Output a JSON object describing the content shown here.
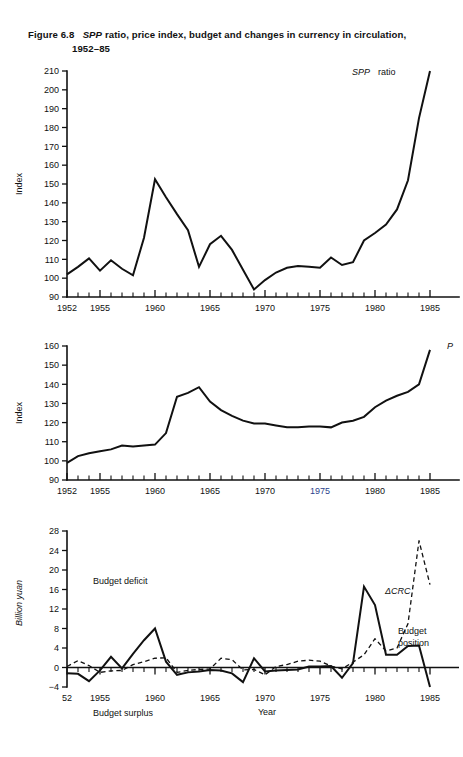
{
  "figure": {
    "number": "Figure 6.8",
    "title_italic_lead": "SPP",
    "title_rest": " ratio, price index, budget and changes in currency in circulation,",
    "title_line2": "1952–85"
  },
  "chart_data": [
    {
      "id": "spp-ratio",
      "type": "line",
      "title": "",
      "xlabel": "",
      "ylabel": "Index",
      "series_label": "SPP ratio",
      "ylim": [
        90,
        210
      ],
      "yticks": [
        90,
        100,
        110,
        120,
        130,
        140,
        150,
        160,
        170,
        180,
        190,
        200,
        210
      ],
      "xlim": [
        1952,
        1986
      ],
      "xticks": [
        1952,
        1955,
        1960,
        1965,
        1970,
        1975,
        1980,
        1985
      ],
      "xtick_labels": [
        "1952",
        "1955",
        "1960",
        "1965",
        "1970",
        "1975",
        "1980",
        "1985"
      ],
      "grid": false,
      "x": [
        1952,
        1953,
        1954,
        1955,
        1956,
        1957,
        1958,
        1959,
        1960,
        1961,
        1962,
        1963,
        1964,
        1965,
        1966,
        1967,
        1968,
        1969,
        1970,
        1971,
        1972,
        1973,
        1974,
        1975,
        1976,
        1977,
        1978,
        1979,
        1980,
        1981,
        1982,
        1983,
        1984,
        1985
      ],
      "values": [
        102,
        106,
        110.5,
        104,
        109.5,
        105,
        101.5,
        121.5,
        152.5,
        143,
        134,
        125.5,
        106,
        118,
        122.5,
        115,
        104.5,
        94,
        99,
        103,
        105.5,
        106.5,
        106,
        105.5,
        111,
        107,
        108.5,
        120,
        124,
        128.5,
        136.5,
        152,
        185,
        210
      ]
    },
    {
      "id": "price-index",
      "type": "line",
      "title": "",
      "xlabel": "",
      "ylabel": "Index",
      "series_label": "P",
      "ylim": [
        90,
        160
      ],
      "yticks": [
        90,
        100,
        110,
        120,
        130,
        140,
        150,
        160
      ],
      "xlim": [
        1952,
        1986
      ],
      "xticks": [
        1952,
        1955,
        1960,
        1965,
        1970,
        1975,
        1980,
        1985
      ],
      "xtick_labels": [
        "1952",
        "1955",
        "1960",
        "1965",
        "1970",
        "1975",
        "1980",
        "1985"
      ],
      "highlight_xtick": "1975",
      "grid": false,
      "x": [
        1952,
        1953,
        1954,
        1955,
        1956,
        1957,
        1958,
        1959,
        1960,
        1961,
        1962,
        1963,
        1964,
        1965,
        1966,
        1967,
        1968,
        1969,
        1970,
        1971,
        1972,
        1973,
        1974,
        1975,
        1976,
        1977,
        1978,
        1979,
        1980,
        1981,
        1982,
        1983,
        1984,
        1985
      ],
      "values": [
        99,
        102.5,
        104,
        105,
        106,
        108,
        107.5,
        108,
        108.5,
        114.5,
        133.5,
        135.5,
        138.5,
        131,
        126.5,
        123.5,
        121,
        119.5,
        119.5,
        118.5,
        117.5,
        117.5,
        118,
        118,
        117.5,
        120,
        121,
        123,
        128,
        131.5,
        134,
        136,
        140,
        158
      ]
    },
    {
      "id": "budget-crc",
      "type": "line",
      "title": "",
      "xlabel": "Year",
      "ylabel": "Billion yuan",
      "ylim": [
        -4,
        28
      ],
      "yticks": [
        -4,
        0,
        4,
        8,
        12,
        16,
        20,
        24,
        28
      ],
      "xlim": [
        1952,
        1986
      ],
      "xticks": [
        1952,
        1955,
        1960,
        1965,
        1970,
        1975,
        1980,
        1985
      ],
      "xtick_labels": [
        "52",
        "1955",
        "1960",
        "1965",
        "1970",
        "1975",
        "1980",
        "1985"
      ],
      "grid": false,
      "annotations": [
        "Budget deficit",
        "Budget surplus"
      ],
      "series": [
        {
          "name": "Budget position",
          "style": "solid",
          "x": [
            1952,
            1953,
            1954,
            1955,
            1956,
            1957,
            1958,
            1959,
            1960,
            1961,
            1962,
            1963,
            1964,
            1965,
            1966,
            1967,
            1968,
            1969,
            1970,
            1971,
            1972,
            1973,
            1974,
            1975,
            1976,
            1977,
            1978,
            1979,
            1980,
            1981,
            1982,
            1983,
            1984,
            1985
          ],
          "values": [
            -1.2,
            -1.3,
            -2.8,
            -0.6,
            2.2,
            -0.2,
            2.8,
            5.6,
            8.0,
            1.2,
            -1.5,
            -1.0,
            -0.8,
            -0.5,
            -0.6,
            -1.2,
            -3.0,
            1.9,
            -0.8,
            -0.6,
            -0.5,
            -0.4,
            0.2,
            0.2,
            0.3,
            -2.1,
            0.9,
            16.6,
            12.8,
            2.6,
            2.6,
            4.4,
            4.5,
            -4.0
          ]
        },
        {
          "name": "ΔCRC",
          "style": "dashed",
          "x": [
            1952,
            1953,
            1954,
            1955,
            1956,
            1957,
            1958,
            1959,
            1960,
            1961,
            1962,
            1963,
            1964,
            1965,
            1966,
            1967,
            1968,
            1969,
            1970,
            1971,
            1972,
            1973,
            1974,
            1975,
            1976,
            1977,
            1978,
            1979,
            1980,
            1981,
            1982,
            1983,
            1984,
            1985
          ],
          "values": [
            0.2,
            1.4,
            0.4,
            -1.0,
            -0.7,
            -0.6,
            0.6,
            1.2,
            1.9,
            2.0,
            -1.0,
            -0.6,
            -0.4,
            -0.3,
            1.9,
            1.6,
            -0.5,
            -0.4,
            -1.5,
            0.2,
            0.6,
            1.3,
            1.5,
            1.3,
            0.3,
            -0.3,
            1.1,
            2.6,
            5.9,
            3.4,
            4.0,
            9.0,
            26.0,
            17.0
          ]
        }
      ]
    }
  ],
  "labels": {
    "index_axis": "Index",
    "billion_yuan_axis": "Billion yuan",
    "year_axis": "Year",
    "spp_ratio_italic": "SPP",
    "spp_ratio_rest": "ratio",
    "p_label": "P",
    "delta_crc": "ΔCRC",
    "budget_position_line1": "Budget",
    "budget_position_line2": "position",
    "budget_deficit": "Budget deficit",
    "budget_surplus": "Budget surplus"
  },
  "colors": {
    "ink": "#111111",
    "paper": "#ffffff",
    "highlight_tick": "#2b3f8c"
  }
}
